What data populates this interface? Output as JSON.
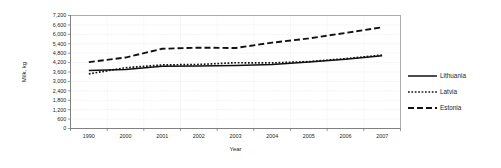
{
  "chart_data": {
    "type": "line",
    "title": "",
    "xlabel": "Year",
    "ylabel": "Milk, kg",
    "categories": [
      "1990",
      "2000",
      "2001",
      "2002",
      "2003",
      "2004",
      "2005",
      "2006",
      "2007"
    ],
    "ylim": [
      0,
      7200
    ],
    "ytick_step": 600,
    "yticks": [
      "7,200",
      "6,600",
      "6,000",
      "5,400",
      "4,800",
      "4,200",
      "3,600",
      "3,000",
      "2,400",
      "1,800",
      "1,200",
      "600",
      "0"
    ],
    "ytick_values": [
      7200,
      6600,
      6000,
      5400,
      4800,
      4200,
      3600,
      3000,
      2400,
      1800,
      1200,
      600,
      0
    ],
    "grid": true,
    "legend_position": "right",
    "series": [
      {
        "name": "Lithuania",
        "style": "solid",
        "values": [
          3700,
          3760,
          3960,
          3980,
          4010,
          4080,
          4230,
          4420,
          4630
        ]
      },
      {
        "name": "Latvia",
        "style": "dotted",
        "values": [
          3480,
          3870,
          4050,
          4080,
          4190,
          4180,
          4260,
          4450,
          4680
        ]
      },
      {
        "name": "Estonia",
        "style": "dashed",
        "values": [
          4230,
          4520,
          5080,
          5150,
          5130,
          5470,
          5740,
          6090,
          6450
        ]
      }
    ]
  },
  "legend": {
    "items": [
      {
        "label": "Lithuania",
        "style": "solid"
      },
      {
        "label": "Latvia",
        "style": "dotted"
      },
      {
        "label": "Estonia",
        "style": "dashed"
      }
    ]
  }
}
